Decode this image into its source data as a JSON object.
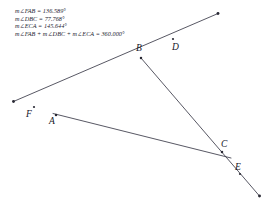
{
  "figure": {
    "title_measurements": [
      "m∠FAB = 136.589°",
      "m∠DBC = 77.768°",
      "m∠ECA = 145.644°",
      "m∠FAB + m∠DBC + m∠ECA = 360.000°"
    ],
    "angles": {
      "FAB": "136.589",
      "DBC": "77.768",
      "ECA": "145.644",
      "sum": "360.000",
      "unit": "°"
    },
    "points": [
      {
        "name": "A",
        "label": "A",
        "x": 56,
        "y": 115,
        "label_x": 49,
        "label_y": 119
      },
      {
        "name": "B",
        "label": "B",
        "x": 141,
        "y": 58,
        "label_x": 135,
        "label_y": 44
      },
      {
        "name": "C",
        "label": "C",
        "x": 222,
        "y": 152,
        "label_x": 218,
        "label_y": 140
      },
      {
        "name": "D",
        "label": "D",
        "x": 170,
        "y": 41,
        "label_x": 165,
        "label_y": 41
      },
      {
        "name": "E",
        "label": "E",
        "x": 238,
        "y": 170,
        "label_x": 233,
        "label_y": 165
      },
      {
        "name": "F",
        "label": "F",
        "x": 34,
        "y": 107,
        "label_x": 26,
        "label_y": 112
      }
    ],
    "segments": [
      {
        "name": "ray-F-A-B-D",
        "from": "arrow-left",
        "to": "arrow-upper-right"
      },
      {
        "name": "ray-B-C-E",
        "from": "B",
        "to": "arrow-lower-right"
      },
      {
        "name": "line-A-C",
        "from": "A",
        "to": "C-extended"
      }
    ],
    "colors": {
      "ink": "#15151f",
      "text": "#1a1a2e",
      "background": "#ffffff"
    }
  }
}
